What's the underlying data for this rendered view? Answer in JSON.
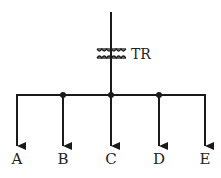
{
  "diagram": {
    "type": "single-line distribution diagram",
    "transformer": {
      "label": "TR"
    },
    "branches": [
      {
        "label": "A"
      },
      {
        "label": "B"
      },
      {
        "label": "C"
      },
      {
        "label": "D"
      },
      {
        "label": "E"
      }
    ],
    "colors": {
      "line": "#1a1a1a",
      "background": "#ffffff"
    }
  }
}
